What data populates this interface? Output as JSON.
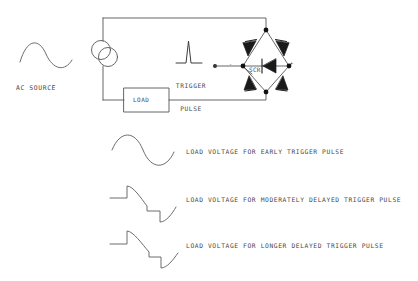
{
  "figure": {
    "type": "schematic-diagram",
    "background_color": "#ffffff",
    "line_color": "#555555",
    "text_color": "#4a4a4a"
  },
  "circuit": {
    "source": {
      "label": "AC SOURCE",
      "waveform": "sine",
      "symbol": "sine-wave"
    },
    "transformer": {
      "symbol": "two-overlapping-circles",
      "label": ""
    },
    "load": {
      "label": "LOAD",
      "symbol": "rectangle-box"
    },
    "trigger": {
      "label": "TRIGGER\nPULSE",
      "line1": "TRIGGER",
      "line2": "PULSE",
      "symbol": "narrow-impulse-spike"
    },
    "bridge": {
      "label": "SCR",
      "device_label": "SCR",
      "topology": "diamond-bridge",
      "diode_count": 4,
      "center_device": "SCR",
      "polarity_left": "-",
      "polarity_right": "+"
    }
  },
  "waveforms": [
    {
      "id": "early",
      "label": "LOAD VOLTAGE FOR EARLY TRIGGER PULSE",
      "shape": "sine",
      "firing_delay": "early"
    },
    {
      "id": "moderate",
      "label": "LOAD VOLTAGE FOR MODERATELY DELAYED TRIGGER PULSE",
      "shape": "phase-chopped-sine",
      "firing_delay": "moderate"
    },
    {
      "id": "longer",
      "label": "LOAD VOLTAGE FOR LONGER DELAYED TRIGGER PULSE",
      "shape": "phase-chopped-sine",
      "firing_delay": "longer"
    }
  ]
}
